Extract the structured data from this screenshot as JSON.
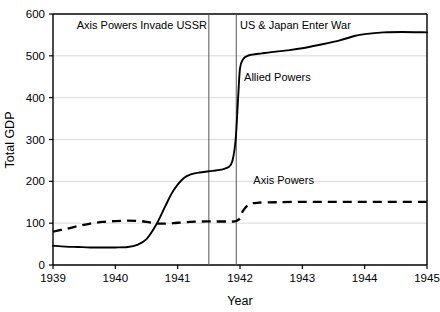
{
  "chart_data": {
    "type": "line",
    "title": "",
    "xlabel": "Year",
    "ylabel": "Total GDP",
    "xlim": [
      1939,
      1945
    ],
    "ylim": [
      0,
      600
    ],
    "grid": true,
    "grid_axis": "y",
    "legend_position": "inline-labels",
    "xticks": [
      "1939",
      "1940",
      "1941",
      "1942",
      "1943",
      "1944",
      "1945"
    ],
    "xtick_values": [
      1939,
      1940,
      1941,
      1942,
      1943,
      1944,
      1945
    ],
    "yticks": [
      "0",
      "100",
      "200",
      "300",
      "400",
      "500",
      "600"
    ],
    "ytick_values": [
      0,
      100,
      200,
      300,
      400,
      500,
      600
    ],
    "series": [
      {
        "name": "Allied Powers",
        "style": "solid",
        "color": "#000000",
        "label_x": 1942.6,
        "label_y": 440,
        "x": [
          1939.0,
          1939.2,
          1939.4,
          1939.6,
          1939.8,
          1940.0,
          1940.2,
          1940.35,
          1940.5,
          1940.65,
          1940.8,
          1940.9,
          1941.0,
          1941.1,
          1941.2,
          1941.35,
          1941.5,
          1941.7,
          1941.82,
          1941.88,
          1941.93,
          1941.97,
          1942.0,
          1942.05,
          1942.12,
          1942.2,
          1942.35,
          1942.5,
          1942.75,
          1943.0,
          1943.3,
          1943.6,
          1943.85,
          1944.0,
          1944.3,
          1944.6,
          1945.0
        ],
        "y": [
          46,
          44,
          43,
          42,
          42,
          42,
          43,
          48,
          62,
          95,
          140,
          170,
          192,
          208,
          216,
          221,
          224,
          228,
          234,
          250,
          300,
          400,
          470,
          492,
          500,
          503,
          506,
          509,
          513,
          518,
          527,
          537,
          548,
          552,
          556,
          557,
          556
        ]
      },
      {
        "name": "Axis Powers",
        "style": "dashed",
        "color": "#000000",
        "label_x": 1942.7,
        "label_y": 193,
        "x": [
          1939.0,
          1939.2,
          1939.4,
          1939.6,
          1939.8,
          1940.0,
          1940.2,
          1940.4,
          1940.55,
          1940.7,
          1940.85,
          1941.0,
          1941.2,
          1941.4,
          1941.6,
          1941.8,
          1941.9,
          1941.95,
          1942.0,
          1942.05,
          1942.15,
          1942.3,
          1942.6,
          1943.0,
          1943.4,
          1943.8,
          1944.2,
          1944.6,
          1945.0
        ],
        "y": [
          80,
          86,
          93,
          99,
          103,
          105,
          106,
          105,
          102,
          99,
          99,
          101,
          103,
          104,
          104,
          104,
          104,
          106,
          112,
          130,
          145,
          149,
          150,
          151,
          151,
          151,
          151,
          151,
          151
        ]
      }
    ],
    "annotations": [
      {
        "text": "Axis Powers Invade USSR",
        "x": 1941.5,
        "label_x": 1941.47,
        "label_y": 565,
        "anchor": "end",
        "line": true
      },
      {
        "text": "US & Japan Enter War",
        "x": 1941.94,
        "label_x": 1942.0,
        "label_y": 565,
        "anchor": "start",
        "line": true
      }
    ]
  },
  "colors": {
    "axis": "#000000",
    "grid": "#d9d9d9",
    "annotation_line": "#555555",
    "background": "#ffffff"
  }
}
